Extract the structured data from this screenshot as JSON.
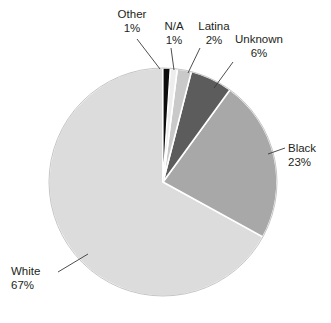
{
  "chart_data": {
    "type": "pie",
    "title": "",
    "subtitle": "",
    "xlabel": "",
    "ylabel": "",
    "legend_position": "none",
    "grid": false,
    "value_unit": "%",
    "start_angle_deg": 0,
    "direction": "clockwise",
    "categories": [
      "Other",
      "N/A",
      "Latina",
      "Unknown",
      "Black",
      "White"
    ],
    "values": [
      1,
      1,
      2,
      6,
      23,
      67
    ],
    "labels": [
      "1%",
      "1%",
      "2%",
      "6%",
      "23%",
      "67%"
    ],
    "colors": [
      "#0d0d0d",
      "#ededed",
      "#c9c9c9",
      "#5c5c5c",
      "#a8a8a8",
      "#dcdcdc"
    ],
    "slices": [
      {
        "name": "Other",
        "value": 1,
        "label": "1%",
        "color": "#0d0d0d"
      },
      {
        "name": "N/A",
        "value": 1,
        "label": "1%",
        "color": "#ededed"
      },
      {
        "name": "Latina",
        "value": 2,
        "label": "2%",
        "color": "#c9c9c9"
      },
      {
        "name": "Unknown",
        "value": 6,
        "label": "6%",
        "color": "#5c5c5c"
      },
      {
        "name": "Black",
        "value": 23,
        "label": "23%",
        "color": "#a8a8a8"
      },
      {
        "name": "White",
        "value": 67,
        "label": "67%",
        "color": "#dcdcdc"
      }
    ]
  },
  "geometry": {
    "center_x": 163,
    "center_y": 182,
    "radius": 114,
    "stroke_color": "#ffffff",
    "outline_color": "#9a9a9a",
    "leader_color": "#3a3a3a"
  }
}
